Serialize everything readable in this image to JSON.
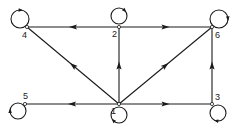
{
  "diagram": {
    "type": "directed-graph",
    "nodes": [
      {
        "id": "1",
        "label": "1",
        "x": 119,
        "y": 104,
        "label_dx": -8,
        "label_dy": 10,
        "loop": {
          "cx": 119,
          "cy": 115,
          "r": 8
        }
      },
      {
        "id": "2",
        "label": "2",
        "x": 119,
        "y": 27,
        "label_dx": -7,
        "label_dy": 10,
        "loop": {
          "cx": 119,
          "cy": 16,
          "r": 8
        }
      },
      {
        "id": "3",
        "label": "3",
        "x": 212,
        "y": 104,
        "label_dx": 3,
        "label_dy": -4,
        "loop": {
          "cx": 218,
          "cy": 113,
          "r": 8
        }
      },
      {
        "id": "4",
        "label": "4",
        "x": 27,
        "y": 27,
        "label_dx": -5,
        "label_dy": 11,
        "loop": {
          "cx": 20,
          "cy": 19,
          "r": 9
        }
      },
      {
        "id": "5",
        "label": "5",
        "x": 25,
        "y": 104,
        "label_dx": -2,
        "label_dy": -5,
        "loop": {
          "cx": 18,
          "cy": 111,
          "r": 8
        }
      },
      {
        "id": "6",
        "label": "6",
        "x": 212,
        "y": 27,
        "label_dx": 3,
        "label_dy": 11,
        "loop": {
          "cx": 219,
          "cy": 19,
          "r": 9
        }
      }
    ],
    "edges": [
      {
        "from": "2",
        "to": "4"
      },
      {
        "from": "2",
        "to": "6"
      },
      {
        "from": "1",
        "to": "4"
      },
      {
        "from": "1",
        "to": "2"
      },
      {
        "from": "1",
        "to": "6"
      },
      {
        "from": "1",
        "to": "5"
      },
      {
        "from": "1",
        "to": "3"
      },
      {
        "from": "3",
        "to": "6"
      }
    ],
    "self_loops": [
      "1",
      "2",
      "3",
      "4",
      "5",
      "6"
    ],
    "colors": {
      "stroke": "#1a1a1a",
      "background": "#ffffff"
    }
  }
}
